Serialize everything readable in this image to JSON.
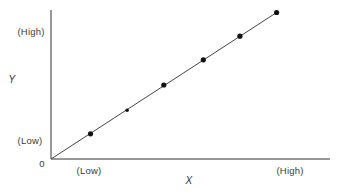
{
  "chart_data": {
    "type": "line",
    "title": "",
    "xlabel": "X",
    "ylabel": "Y",
    "origin_label": "0",
    "x_tick_labels": [
      "(Low)",
      "(High)"
    ],
    "y_tick_labels": [
      "(Low)",
      "(High)"
    ],
    "grid": false,
    "legend": null,
    "series": [
      {
        "name": "Y vs X (linear)",
        "line_from_origin": true,
        "points": [
          {
            "x": 0.14,
            "y": 0.17
          },
          {
            "x": 0.27,
            "y": 0.33
          },
          {
            "x": 0.4,
            "y": 0.5
          },
          {
            "x": 0.54,
            "y": 0.67
          },
          {
            "x": 0.67,
            "y": 0.83
          },
          {
            "x": 0.8,
            "y": 0.99
          }
        ]
      }
    ],
    "xlim": [
      0,
      1
    ],
    "ylim": [
      0,
      1
    ],
    "colors": {
      "axis": "#333333",
      "line": "#444444",
      "marker": "#111111"
    }
  },
  "labels": {
    "y_title": "Y",
    "x_title": "X",
    "origin": "0",
    "y_high": "(High)",
    "y_low": "(Low)",
    "x_low": "(Low)",
    "x_high": "(High)"
  }
}
